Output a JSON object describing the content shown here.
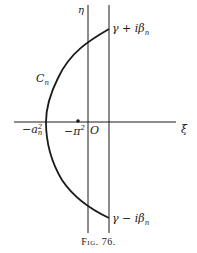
{
  "figure": {
    "caption": "Fig. 76.",
    "colors": {
      "ink": "#1a1a1a",
      "background": "#ffffff"
    }
  },
  "axes": {
    "horizontal_label": "ξ",
    "vertical_label": "η",
    "origin_label": "O"
  },
  "labels": {
    "curve": {
      "main": "C",
      "sub": "n"
    },
    "top_point": {
      "main": "γ + iβ",
      "sub": "n"
    },
    "bottom_point": {
      "main": "γ − iβ",
      "sub": "n"
    },
    "vertex": {
      "prefix": "−a",
      "sub": "n",
      "sup": "2"
    },
    "pole": {
      "prefix": "−π",
      "sup": "2"
    }
  },
  "geometry": {
    "horizontal_axis_y": 122,
    "eta_axis_x": 88,
    "gamma_line_x": 109,
    "vertex_x": 46,
    "pole_x": 78
  }
}
